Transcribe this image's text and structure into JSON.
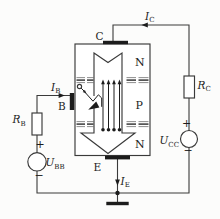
{
  "figure": {
    "type": "circuit-diagram",
    "colors": {
      "bg": "#fcfcfb",
      "ink": "#3a3a3a",
      "ink_dark": "#1c1c1c",
      "hatch": "#8f8f8f",
      "hatch_mid": "#565656"
    },
    "terminals": {
      "collector": "C",
      "base": "B",
      "emitter": "E"
    },
    "regions": {
      "top": "N",
      "middle": "P",
      "bottom": "N"
    },
    "currents": {
      "collector": {
        "main": "I",
        "sub": "C"
      },
      "base": {
        "main": "I",
        "sub": "B"
      },
      "emitter": {
        "main": "I",
        "sub": "E"
      }
    },
    "resistors": {
      "base": {
        "main": "R",
        "sub": "B"
      },
      "collector": {
        "main": "R",
        "sub": "C"
      }
    },
    "sources": {
      "base": {
        "main": "U",
        "sub": "BB",
        "plus": "+",
        "minus": "−"
      },
      "collector": {
        "main": "U",
        "sub": "CC",
        "plus": "+",
        "minus": "−"
      }
    }
  }
}
